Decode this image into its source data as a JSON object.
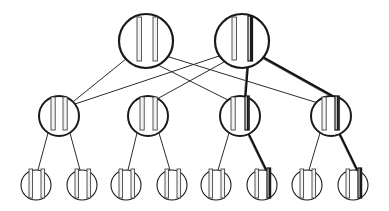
{
  "figure": {
    "background_color": "#ffffff",
    "width": 389,
    "height": 211
  },
  "style": {
    "node_stroke_color": "#1a1a1a",
    "node_fill_color": "#ffffff",
    "bar_outline_color": "#3a3a3a",
    "bar_fill_color": "#f2f2f2",
    "bar_highlight_color": "#1a1a1a",
    "edge_color": "#2b2b2b",
    "edge_highlight_color": "#111111",
    "edge_width_normal": 1,
    "edge_width_bold": 2.6,
    "node_stroke_width_root": 2.2,
    "node_stroke_width_mid": 2.0,
    "node_stroke_width_leaf": 1.1
  },
  "levels": [
    {
      "name": "root-level",
      "index": 0,
      "y": 41,
      "node_radius": 27,
      "node_count": 2
    },
    {
      "name": "middle-level",
      "index": 1,
      "y": 116,
      "node_radius": 20,
      "node_count": 4
    },
    {
      "name": "leaf-level",
      "index": 2,
      "y": 185,
      "node_radius": 15,
      "node_count": 8
    }
  ],
  "nodes": [
    {
      "id": "r1",
      "label": "root-node-1",
      "level": 0,
      "cx": 146,
      "cy": 41,
      "r": 27,
      "bars": [
        {
          "x_offset": -9,
          "top": -24,
          "bottom": 20,
          "width": 4.5,
          "highlight": false
        },
        {
          "x_offset": 7,
          "top": -24,
          "bottom": 20,
          "width": 4.5,
          "highlight": false
        }
      ]
    },
    {
      "id": "r2",
      "label": "root-node-2",
      "level": 0,
      "cx": 242,
      "cy": 41,
      "r": 27,
      "bars": [
        {
          "x_offset": -10,
          "top": -24,
          "bottom": 19,
          "width": 4.5,
          "highlight": false
        },
        {
          "x_offset": 6,
          "top": -25,
          "bottom": 20,
          "width": 4.5,
          "highlight": true
        }
      ]
    },
    {
      "id": "m1",
      "label": "middle-node-1",
      "level": 1,
      "cx": 59,
      "cy": 116,
      "r": 20,
      "bars": [
        {
          "x_offset": -8,
          "top": -19,
          "bottom": 14,
          "width": 4.2,
          "highlight": false
        },
        {
          "x_offset": 4,
          "top": -19,
          "bottom": 14,
          "width": 4.2,
          "highlight": false
        }
      ]
    },
    {
      "id": "m2",
      "label": "middle-node-2",
      "level": 1,
      "cx": 148,
      "cy": 116,
      "r": 20,
      "bars": [
        {
          "x_offset": -8,
          "top": -19,
          "bottom": 14,
          "width": 4.2,
          "highlight": false
        },
        {
          "x_offset": 5,
          "top": -19,
          "bottom": 14,
          "width": 4.2,
          "highlight": false
        }
      ]
    },
    {
      "id": "m3",
      "label": "middle-node-3",
      "level": 1,
      "cx": 240,
      "cy": 116,
      "r": 20,
      "bars": [
        {
          "x_offset": -9,
          "top": -19,
          "bottom": 14,
          "width": 4.2,
          "highlight": false
        },
        {
          "x_offset": 5,
          "top": -20,
          "bottom": 14,
          "width": 4.2,
          "highlight": true
        }
      ]
    },
    {
      "id": "m4",
      "label": "middle-node-4",
      "level": 1,
      "cx": 331,
      "cy": 116,
      "r": 20,
      "bars": [
        {
          "x_offset": -9,
          "top": -19,
          "bottom": 14,
          "width": 4.2,
          "highlight": false
        },
        {
          "x_offset": 4,
          "top": -20,
          "bottom": 14,
          "width": 4.2,
          "highlight": true
        }
      ]
    },
    {
      "id": "l1",
      "label": "leaf-node-1",
      "level": 2,
      "cx": 36,
      "cy": 185,
      "r": 15,
      "bars": [
        {
          "x_offset": -7,
          "top": -16,
          "bottom": 13,
          "width": 3.6,
          "highlight": false
        },
        {
          "x_offset": 5,
          "top": -16,
          "bottom": 13,
          "width": 3.6,
          "highlight": false
        }
      ]
    },
    {
      "id": "l2",
      "label": "leaf-node-2",
      "level": 2,
      "cx": 82,
      "cy": 185,
      "r": 15,
      "bars": [
        {
          "x_offset": -7,
          "top": -16,
          "bottom": 13,
          "width": 3.6,
          "highlight": false
        },
        {
          "x_offset": 5,
          "top": -16,
          "bottom": 13,
          "width": 3.6,
          "highlight": false
        }
      ]
    },
    {
      "id": "l3",
      "label": "leaf-node-3",
      "level": 2,
      "cx": 126,
      "cy": 185,
      "r": 15,
      "bars": [
        {
          "x_offset": -7,
          "top": -16,
          "bottom": 13,
          "width": 3.6,
          "highlight": false
        },
        {
          "x_offset": 5,
          "top": -16,
          "bottom": 13,
          "width": 3.6,
          "highlight": false
        }
      ]
    },
    {
      "id": "l4",
      "label": "leaf-node-4",
      "level": 2,
      "cx": 172,
      "cy": 185,
      "r": 15,
      "bars": [
        {
          "x_offset": -7,
          "top": -16,
          "bottom": 13,
          "width": 3.6,
          "highlight": false
        },
        {
          "x_offset": 5,
          "top": -16,
          "bottom": 13,
          "width": 3.6,
          "highlight": false
        }
      ]
    },
    {
      "id": "l5",
      "label": "leaf-node-5",
      "level": 2,
      "cx": 216,
      "cy": 185,
      "r": 15,
      "bars": [
        {
          "x_offset": -7,
          "top": -16,
          "bottom": 13,
          "width": 3.6,
          "highlight": false
        },
        {
          "x_offset": 5,
          "top": -16,
          "bottom": 13,
          "width": 3.6,
          "highlight": false
        }
      ]
    },
    {
      "id": "l6",
      "label": "leaf-node-6",
      "level": 2,
      "cx": 262,
      "cy": 185,
      "r": 15,
      "bars": [
        {
          "x_offset": -7,
          "top": -16,
          "bottom": 13,
          "width": 3.6,
          "highlight": false
        },
        {
          "x_offset": 5,
          "top": -17,
          "bottom": 13,
          "width": 3.6,
          "highlight": true
        }
      ]
    },
    {
      "id": "l7",
      "label": "leaf-node-7",
      "level": 2,
      "cx": 307,
      "cy": 185,
      "r": 15,
      "bars": [
        {
          "x_offset": -7,
          "top": -16,
          "bottom": 13,
          "width": 3.6,
          "highlight": false
        },
        {
          "x_offset": 5,
          "top": -16,
          "bottom": 13,
          "width": 3.6,
          "highlight": false
        }
      ]
    },
    {
      "id": "l8",
      "label": "leaf-node-8",
      "level": 2,
      "cx": 353,
      "cy": 185,
      "r": 15,
      "bars": [
        {
          "x_offset": -7,
          "top": -16,
          "bottom": 13,
          "width": 3.6,
          "highlight": false
        },
        {
          "x_offset": 5,
          "top": -17,
          "bottom": 13,
          "width": 3.6,
          "highlight": true
        }
      ]
    }
  ],
  "edges": [
    {
      "id": "e1",
      "label": "edge-root1-mid1",
      "from": "r1",
      "to": "m1",
      "x1": 126,
      "y1": 59,
      "x2": 74,
      "y2": 101,
      "bold": false
    },
    {
      "id": "e2",
      "label": "edge-root1-mid3",
      "from": "r1",
      "to": "m3",
      "x1": 158,
      "y1": 65,
      "x2": 228,
      "y2": 100,
      "bold": false
    },
    {
      "id": "e3",
      "label": "edge-root1-mid4",
      "from": "r1",
      "to": "m4",
      "x1": 166,
      "y1": 56,
      "x2": 318,
      "y2": 103,
      "bold": false
    },
    {
      "id": "e4",
      "label": "edge-root2-mid1",
      "from": "r2",
      "to": "m1",
      "x1": 219,
      "y1": 56,
      "x2": 72,
      "y2": 105,
      "bold": false
    },
    {
      "id": "e5",
      "label": "edge-root2-mid2",
      "from": "r2",
      "to": "m2",
      "x1": 224,
      "y1": 62,
      "x2": 157,
      "y2": 99,
      "bold": false
    },
    {
      "id": "e6",
      "label": "edge-root2-mid3-bold",
      "from": "r2",
      "to": "m3",
      "x1": 248,
      "y1": 61,
      "x2": 245,
      "y2": 99,
      "bold": true
    },
    {
      "id": "e7",
      "label": "edge-root2-mid4-bold",
      "from": "r2",
      "to": "m4",
      "x1": 262,
      "y1": 57,
      "x2": 341,
      "y2": 101,
      "bold": true
    },
    {
      "id": "e8",
      "label": "edge-mid1-leaf1",
      "from": "m1",
      "to": "l1",
      "x1": 48,
      "y1": 133,
      "x2": 38,
      "y2": 170,
      "bold": false
    },
    {
      "id": "e9",
      "label": "edge-mid1-leaf2",
      "from": "m1",
      "to": "l2",
      "x1": 70,
      "y1": 133,
      "x2": 80,
      "y2": 170,
      "bold": false
    },
    {
      "id": "e10",
      "label": "edge-mid2-leaf3",
      "from": "m2",
      "to": "l3",
      "x1": 137,
      "y1": 133,
      "x2": 128,
      "y2": 170,
      "bold": false
    },
    {
      "id": "e11",
      "label": "edge-mid2-leaf4",
      "from": "m2",
      "to": "l4",
      "x1": 159,
      "y1": 133,
      "x2": 170,
      "y2": 170,
      "bold": false
    },
    {
      "id": "e12",
      "label": "edge-mid3-leaf5",
      "from": "m3",
      "to": "l5",
      "x1": 229,
      "y1": 133,
      "x2": 218,
      "y2": 170,
      "bold": false
    },
    {
      "id": "e13",
      "label": "edge-mid3-leaf6-bold",
      "from": "m3",
      "to": "l6",
      "x1": 248,
      "y1": 133,
      "x2": 266,
      "y2": 170,
      "bold": true
    },
    {
      "id": "e14",
      "label": "edge-mid4-leaf7",
      "from": "m4",
      "to": "l7",
      "x1": 320,
      "y1": 133,
      "x2": 309,
      "y2": 170,
      "bold": false
    },
    {
      "id": "e15",
      "label": "edge-mid4-leaf8-bold",
      "from": "m4",
      "to": "l8",
      "x1": 339,
      "y1": 133,
      "x2": 357,
      "y2": 170,
      "bold": true
    }
  ]
}
